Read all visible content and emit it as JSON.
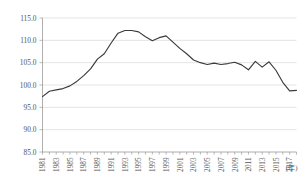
{
  "chart_data": {
    "type": "line",
    "title": "",
    "subtitle": "",
    "xlabel": "",
    "ylabel": "",
    "xunit": "(年)",
    "grid": true,
    "legend": "none",
    "ylim": [
      85.0,
      115.0
    ],
    "yticks": [
      85.0,
      90.0,
      95.0,
      100.0,
      105.0,
      110.0,
      115.0
    ],
    "ytick_labels": [
      "85.0",
      "90.0",
      "95.0",
      "100.0",
      "105.0",
      "110.0",
      "115.0"
    ],
    "xlim": [
      1981,
      2018
    ],
    "xticks": [
      1981,
      1983,
      1985,
      1987,
      1989,
      1991,
      1993,
      1995,
      1997,
      1999,
      2001,
      2003,
      2005,
      2007,
      2009,
      2011,
      2013,
      2015,
      2017
    ],
    "xtick_labels": [
      "1981",
      "1983",
      "1985",
      "1987",
      "1989",
      "1991",
      "1993",
      "1995",
      "1997",
      "1999",
      "2001",
      "2003",
      "2005",
      "2007",
      "2009",
      "2011",
      "2013",
      "2015",
      "2017"
    ],
    "series": [
      {
        "name": "index",
        "color": "#3a3a3a",
        "x": [
          1981,
          1982,
          1983,
          1984,
          1985,
          1986,
          1987,
          1988,
          1989,
          1990,
          1991,
          1992,
          1993,
          1994,
          1995,
          1996,
          1997,
          1998,
          1999,
          2000,
          2001,
          2002,
          2003,
          2004,
          2005,
          2006,
          2007,
          2008,
          2009,
          2010,
          2011,
          2012,
          2013,
          2014,
          2015,
          2016,
          2017,
          2018
        ],
        "values": [
          97.4,
          98.6,
          98.9,
          99.2,
          99.8,
          100.8,
          102.1,
          103.6,
          105.8,
          107.0,
          109.4,
          111.6,
          112.2,
          112.2,
          111.9,
          110.8,
          109.9,
          110.6,
          111.0,
          109.6,
          108.2,
          107.0,
          105.6,
          105.0,
          104.6,
          104.9,
          104.6,
          104.8,
          105.1,
          104.5,
          103.4,
          105.3,
          104.0,
          105.2,
          103.3,
          100.6,
          98.7,
          98.8
        ]
      }
    ]
  }
}
